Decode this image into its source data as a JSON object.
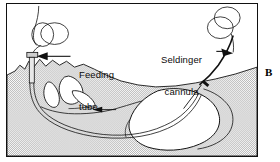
{
  "figure": {
    "panel_letter": "B",
    "type": "medical-line-illustration",
    "background_color": "#ffffff",
    "line_color": "#111111",
    "tissue_fill": "#c9c9c9",
    "organ_fill": "#ffffff"
  },
  "labels": [
    {
      "id": "feeding-tube",
      "text": "Feeding\ntube",
      "line1": "Feeding",
      "line2": "tube",
      "arrow_direction": "left"
    },
    {
      "id": "seldinger-cannula",
      "text": "Seldinger\ncannula",
      "line1": "Seldinger",
      "line2": "cannula",
      "arrow_direction": "right-down"
    }
  ],
  "anatomy": [
    {
      "id": "head-tissue",
      "name": "head and neck soft tissue (stippled)"
    },
    {
      "id": "nasal-cavity",
      "name": "nasal cavity and turbinates"
    },
    {
      "id": "oral-cavity",
      "name": "oral cavity / tongue"
    },
    {
      "id": "esophagus",
      "name": "esophagus"
    },
    {
      "id": "stomach",
      "name": "stomach"
    }
  ],
  "devices": [
    {
      "id": "feeding-tube-coil",
      "name": "coiled feeding tube with connector hub"
    },
    {
      "id": "seldinger-cannula-coil",
      "name": "coiled Seldinger cannula with needle tip"
    },
    {
      "id": "feeding-tube-path",
      "name": "feeding tube routed nose to stomach"
    },
    {
      "id": "seldinger-wire-path",
      "name": "Seldinger cannula entering neck to stomach"
    }
  ]
}
